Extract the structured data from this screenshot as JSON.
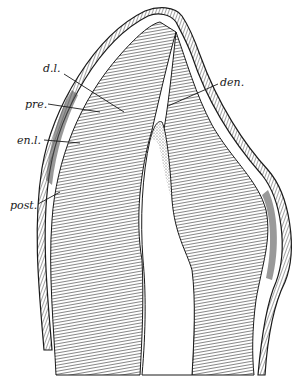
{
  "figure": {
    "labels": [
      {
        "id": "dl",
        "text": "d.l.",
        "x": 43,
        "y": 68
      },
      {
        "id": "pre",
        "text": "pre.",
        "x": 25,
        "y": 98
      },
      {
        "id": "enl",
        "text": "en.l.",
        "x": 17,
        "y": 133
      },
      {
        "id": "post",
        "text": "post.",
        "x": 10,
        "y": 199
      },
      {
        "id": "den",
        "text": "den.",
        "x": 220,
        "y": 76
      }
    ],
    "colors": {
      "ink": "#1a1a1a",
      "shade": "#6b6b6b",
      "paper": "#ffffff"
    }
  }
}
